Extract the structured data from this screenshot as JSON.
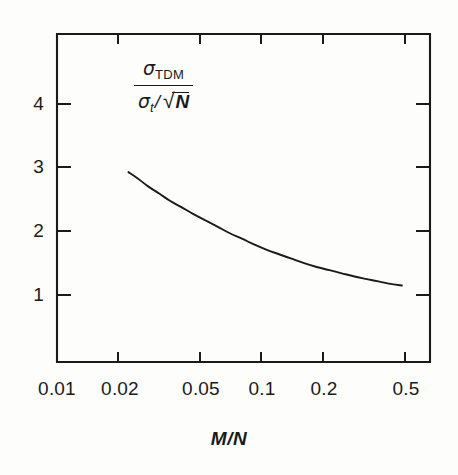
{
  "figure": {
    "background_color": "#fdfdfc",
    "ink_color": "#1a1a1a"
  },
  "ylabel": {
    "numerator_symbol": "σ",
    "numerator_subscript": "TDM",
    "denominator_symbol": "σ",
    "denominator_subscript": "t",
    "denominator_slash": "/",
    "radical_sign": "√",
    "radicand": "N"
  },
  "xaxis_title": "M/N",
  "chart_data": {
    "type": "line",
    "title": "",
    "xlabel": "M/N",
    "ylabel": "sigma_TDM / (sigma_t / sqrt(N))",
    "xscale": "log",
    "yscale": "linear",
    "xlim": [
      0.01,
      0.5
    ],
    "ylim": [
      0.0,
      4.85
    ],
    "grid": false,
    "legend": false,
    "xticks": [
      0.01,
      0.02,
      0.05,
      0.1,
      0.2,
      0.5
    ],
    "xtick_labels": [
      "0.01",
      "0.02",
      "0.05",
      "0.1",
      "0.2",
      "0.5"
    ],
    "yticks": [
      1,
      2,
      3,
      4
    ],
    "ytick_labels": [
      "1",
      "2",
      "3",
      "4"
    ],
    "series": [
      {
        "name": "sigma_TDM ratio",
        "color": "#1a1a1a",
        "x": [
          0.0225,
          0.025,
          0.028,
          0.032,
          0.036,
          0.041,
          0.047,
          0.054,
          0.062,
          0.071,
          0.082,
          0.094,
          0.108,
          0.124,
          0.143,
          0.165,
          0.19,
          0.22,
          0.253,
          0.292,
          0.336,
          0.388,
          0.447,
          0.5
        ],
        "y": [
          2.93,
          2.83,
          2.71,
          2.59,
          2.48,
          2.38,
          2.27,
          2.17,
          2.07,
          1.97,
          1.88,
          1.79,
          1.71,
          1.64,
          1.57,
          1.5,
          1.44,
          1.39,
          1.34,
          1.29,
          1.25,
          1.21,
          1.17,
          1.15
        ]
      }
    ]
  }
}
